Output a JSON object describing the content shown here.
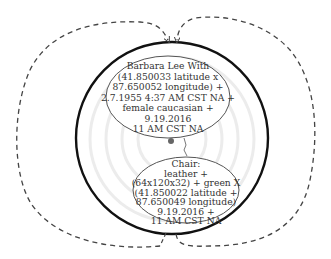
{
  "diagram": {
    "colors": {
      "background": "#ffffff",
      "outer_circle_stroke": "#111111",
      "ellipse_stroke": "#555555",
      "dashed_loop_stroke": "#444444",
      "ripple_rings": "#ececec",
      "dot": "#666666",
      "text": "#333333"
    },
    "person_node": {
      "lines": [
        "Barbara Lee With",
        "(41.850033 latitude x",
        "87.650052 longitude) +",
        "2.7.1955  4:37 AM CST NA +",
        "female caucasian +",
        "9.19.2016",
        "11 AM CST NA"
      ]
    },
    "chair_node": {
      "lines": [
        "Chair:",
        "leather +",
        "(64x120x32) + green X",
        "(41.850022 latitude +",
        "87.650049 longitude)",
        "9.19.2016 +",
        "11 AM CST NA"
      ]
    },
    "loops": {
      "left_loop": "dashed-cycle-left",
      "right_loop": "dashed-cycle-right"
    }
  }
}
